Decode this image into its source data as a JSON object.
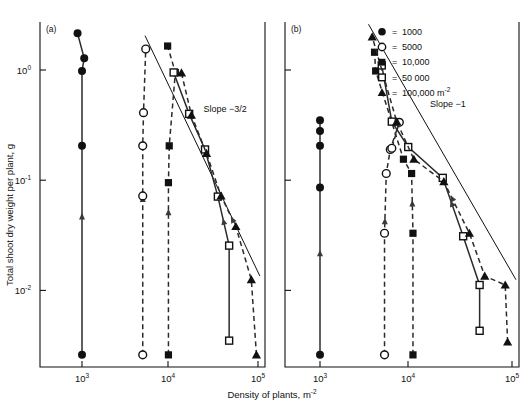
{
  "figure": {
    "axis_titles": {
      "y": "Total shoot dry weight per plant, g",
      "x": "Density of plants, m",
      "x_exp": "-2"
    }
  },
  "legend": {
    "items": [
      {
        "marker": "filled-circle",
        "eq": "=",
        "label": "1000"
      },
      {
        "marker": "open-circle",
        "eq": "=",
        "label": "5000"
      },
      {
        "marker": "filled-square",
        "eq": "=",
        "label": "10,000"
      },
      {
        "marker": "open-square",
        "eq": "=",
        "label": "50 000"
      },
      {
        "marker": "filled-triangle",
        "eq": "=",
        "label": "100,000 m",
        "sup": "-2"
      }
    ]
  },
  "chart_data": {
    "type": "scatter",
    "title": "",
    "xlabel": "Density of plants, m-2",
    "ylabel": "Total shoot dry weight per plant, g",
    "xscale": "log",
    "yscale": "log",
    "xlim": [
      500,
      130000
    ],
    "ylim": [
      0.0022,
      3.2
    ],
    "xticks": [
      1000,
      10000,
      100000
    ],
    "xticklabels": [
      "10",
      "10",
      "10"
    ],
    "xtickexps": [
      "3",
      "4",
      "5"
    ],
    "yticks": [
      1,
      0.1,
      0.01
    ],
    "yticklabels": [
      "10",
      "10",
      "10"
    ],
    "ytickexps": [
      "0",
      "-1",
      "-2"
    ],
    "grid": false,
    "legend_position": "top-right-outside",
    "panels": [
      {
        "id": "a",
        "label": "(a)",
        "annotation": "Slope −3/2",
        "annotation_x": 24000,
        "annotation_y": 0.42,
        "refline": {
          "slope": -1.5,
          "x0": 5200,
          "y0": 2.05,
          "x1": 105000,
          "y1": 0.0135
        },
        "series": [
          {
            "name": "1000",
            "marker": "filled-circle",
            "line": "solid",
            "points": [
              [
                1000,
                0.0026
              ],
              [
                1000,
                0.205
              ],
              [
                1000,
                0.98
              ],
              [
                1060,
                1.28
              ],
              [
                890,
                2.15
              ]
            ],
            "arrow_at": 0.42
          },
          {
            "name": "5000",
            "marker": "open-circle",
            "line": "dashed",
            "points": [
              [
                4900,
                0.0026
              ],
              [
                4900,
                0.072
              ],
              [
                4900,
                0.205
              ],
              [
                5000,
                0.41
              ],
              [
                5300,
                1.55
              ]
            ],
            "arrow_at": 0.5
          },
          {
            "name": "10,000",
            "marker": "filled-square",
            "line": "dashed",
            "points": [
              [
                9600,
                0.0026
              ],
              [
                9600,
                0.095
              ],
              [
                9800,
                0.205
              ],
              [
                11500,
                0.95
              ],
              [
                9400,
                1.65
              ]
            ],
            "arrow_at": 0.45
          },
          {
            "name": "50 000",
            "marker": "open-square",
            "line": "solid",
            "points": [
              [
                47000,
                0.0035
              ],
              [
                47000,
                0.0255
              ],
              [
                35000,
                0.071
              ],
              [
                25000,
                0.19
              ],
              [
                16500,
                0.4
              ],
              [
                11000,
                0.95
              ]
            ],
            "arrow_at": 0.42
          },
          {
            "name": "100,000",
            "marker": "filled-triangle",
            "line": "dashed",
            "points": [
              [
                96000,
                0.0026
              ],
              [
                84000,
                0.0125
              ],
              [
                56000,
                0.038
              ],
              [
                38000,
                0.072
              ],
              [
                26000,
                0.175
              ],
              [
                17500,
                0.39
              ],
              [
                13500,
                0.94
              ]
            ],
            "arrow_at": 0.46
          }
        ]
      },
      {
        "id": "b",
        "label": "(b)",
        "annotation": "Slope −1",
        "annotation_x": 14000,
        "annotation_y": 0.46,
        "refline": {
          "slope": -1.5,
          "x0": 3200,
          "y0": 2.6,
          "x1": 110000,
          "y1": 0.0125
        },
        "series": [
          {
            "name": "1000",
            "marker": "filled-circle",
            "line": "solid",
            "points": [
              [
                1000,
                0.0026
              ],
              [
                1000,
                0.086
              ],
              [
                1000,
                0.205
              ],
              [
                1000,
                0.28
              ],
              [
                1000,
                0.35
              ]
            ],
            "arrow_at": 0.42
          },
          {
            "name": "5000",
            "marker": "open-circle",
            "line": "dashed",
            "points": [
              [
                4700,
                0.0026
              ],
              [
                4700,
                0.033
              ],
              [
                4900,
                0.115
              ],
              [
                5400,
                0.19
              ],
              [
                6700,
                0.335
              ],
              [
                5600,
                0.195
              ]
            ],
            "arrow_at": 0.5
          },
          {
            "name": "10,000",
            "marker": "filled-square",
            "line": "dashed",
            "points": [
              [
                9300,
                0.0026
              ],
              [
                9300,
                0.033
              ],
              [
                9000,
                0.115
              ],
              [
                7400,
                0.155
              ],
              [
                3800,
                0.98
              ],
              [
                3700,
                1.45
              ]
            ],
            "arrow_at": 0.48
          },
          {
            "name": "50 000",
            "marker": "open-square",
            "line": "solid",
            "points": [
              [
                46000,
                0.0043
              ],
              [
                46000,
                0.0112
              ],
              [
                31000,
                0.031
              ],
              [
                19000,
                0.105
              ],
              [
                8300,
                0.2
              ],
              [
                5600,
                0.34
              ],
              [
                4400,
                1.1
              ]
            ],
            "arrow_at": 0.44
          },
          {
            "name": "100,000",
            "marker": "filled-triangle",
            "line": "dashed",
            "points": [
              [
                90000,
                0.0034
              ],
              [
                85000,
                0.0112
              ],
              [
                52000,
                0.0135
              ],
              [
                36000,
                0.033
              ],
              [
                19500,
                0.097
              ],
              [
                9500,
                0.155
              ],
              [
                6300,
                0.34
              ],
              [
                3500,
                2.0
              ]
            ],
            "arrow_at": 0.46
          }
        ]
      }
    ]
  }
}
